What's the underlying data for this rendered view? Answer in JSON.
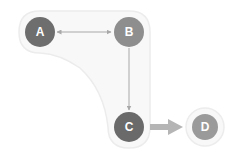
{
  "diagram": {
    "nodes": [
      {
        "id": "A",
        "label": "A",
        "cx": 40,
        "cy": 32,
        "r": 15,
        "color": "#6e6e6e"
      },
      {
        "id": "B",
        "label": "B",
        "cx": 129,
        "cy": 32,
        "r": 15,
        "color": "#8e8e8e"
      },
      {
        "id": "C",
        "label": "C",
        "cx": 129,
        "cy": 127,
        "r": 15,
        "color": "#6a6a6a"
      },
      {
        "id": "D",
        "label": "D",
        "cx": 205,
        "cy": 127,
        "r": 13,
        "color": "#9a9a9a"
      }
    ],
    "edges": [
      {
        "from": "A",
        "to": "B",
        "type": "bidirectional",
        "color": "#a8a8a8"
      },
      {
        "from": "B",
        "to": "C",
        "type": "directed",
        "color": "#a8a8a8"
      },
      {
        "from": "C",
        "to": "D",
        "type": "directed-thick",
        "color": "#b0b0b0"
      }
    ],
    "groups": [
      {
        "members": [
          "A",
          "B",
          "C"
        ],
        "fill": "#f7f7f7",
        "stroke": "#ebebeb"
      },
      {
        "members": [
          "D"
        ],
        "fill": "#f7f7f7",
        "stroke": "#ebebeb"
      }
    ]
  }
}
